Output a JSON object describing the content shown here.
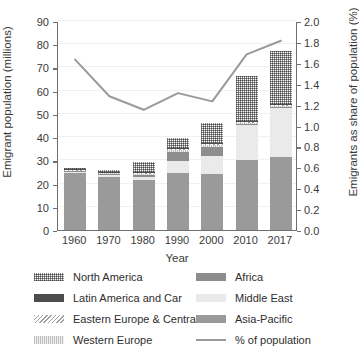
{
  "chart_data": {
    "type": "bar",
    "subtype": "stacked-bar-with-line",
    "title": "",
    "xlabel": "Year",
    "ylabel": "Emigrant population (millions)",
    "y2label": "Emigrants as share of population (%)",
    "categories": [
      "1960",
      "1970",
      "1980",
      "1990",
      "2000",
      "2010",
      "2017"
    ],
    "ylim": [
      0,
      90
    ],
    "yticks": [
      "0",
      "10",
      "20",
      "30",
      "40",
      "50",
      "60",
      "70",
      "80",
      "90"
    ],
    "y2lim": [
      0.0,
      2.0
    ],
    "y2ticks": [
      "0.0",
      "0.2",
      "0.4",
      "0.6",
      "0.8",
      "1.0",
      "1.2",
      "1.4",
      "1.6",
      "1.8",
      "2.0"
    ],
    "grid": true,
    "legend_position": "bottom",
    "series": [
      {
        "name": "Asia-Pacific",
        "key": "asia",
        "values": [
          24.4,
          23.0,
          21.4,
          24.5,
          24.1,
          30.0,
          31.6
        ]
      },
      {
        "name": "Middle East",
        "key": "mideast",
        "values": [
          0.5,
          0.6,
          1.4,
          5.2,
          7.9,
          15.5,
          21.0
        ]
      },
      {
        "name": "Africa",
        "key": "africa",
        "values": [
          0.4,
          0.5,
          1.0,
          4.1,
          3.9,
          0.2,
          0.2
        ]
      },
      {
        "name": "Western Europe",
        "key": "weur",
        "values": [
          0.3,
          0.3,
          0.4,
          0.5,
          0.5,
          0.5,
          0.5
        ]
      },
      {
        "name": "Eastern Europe & Central Asia",
        "key": "eeur",
        "values": [
          0.3,
          0.3,
          0.4,
          0.5,
          0.5,
          0.4,
          0.4
        ]
      },
      {
        "name": "Latin America and Car",
        "key": "latam",
        "values": [
          0.2,
          0.2,
          0.3,
          0.4,
          0.4,
          0.4,
          0.4
        ]
      },
      {
        "name": "North America",
        "key": "noram",
        "values": [
          0.8,
          0.9,
          4.2,
          4.6,
          9.0,
          19.2,
          23.0
        ]
      }
    ],
    "line": {
      "name": "% of population",
      "axis": "right",
      "values": [
        1.64,
        1.29,
        1.16,
        1.32,
        1.24,
        1.69,
        1.82
      ],
      "color": "#9a9a9a"
    }
  },
  "legend": {
    "left_column": [
      {
        "label": "North America",
        "swatch": "noram"
      },
      {
        "label": "Latin America and Car",
        "swatch": "latam"
      },
      {
        "label": "Eastern Europe & Central Asia",
        "swatch": "eeur"
      },
      {
        "label": "Western Europe",
        "swatch": "weur"
      }
    ],
    "right_column": [
      {
        "label": "Africa",
        "swatch": "africa"
      },
      {
        "label": "Middle East",
        "swatch": "mideast"
      },
      {
        "label": "Asia-Pacific",
        "swatch": "asia"
      },
      {
        "label": "% of population",
        "swatch": "line"
      }
    ]
  },
  "colors": {
    "asia": "#9a9a9a",
    "mideast": "#eaeaea",
    "africa": "#8d8d8d",
    "latam": "#4d4d4d",
    "line": "#9a9a9a",
    "axis": "#6f6f6f",
    "grid": "#f0f0f0",
    "text": "#3a3a3a"
  }
}
